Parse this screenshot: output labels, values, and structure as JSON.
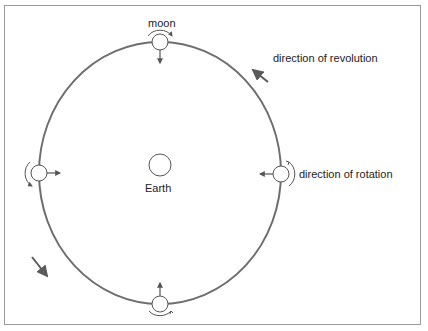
{
  "diagram": {
    "title_labels": {
      "moon": "moon",
      "earth": "Earth",
      "revolution": "direction of revolution",
      "rotation": "direction of rotation"
    },
    "colors": {
      "orbit": "#6e6e6e",
      "arrow": "#5a5a5a",
      "frame": "#9a9a9a",
      "text": "#222222"
    },
    "moon_positions": [
      "top",
      "right",
      "bottom",
      "left"
    ],
    "arrows": [
      "revolution-arrow-top-right",
      "revolution-arrow-bottom-left"
    ]
  }
}
